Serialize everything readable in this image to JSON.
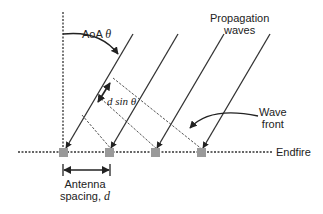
{
  "labels": {
    "aoa": "AoA",
    "theta": "θ",
    "propagation_line1": "Propagation",
    "propagation_line2": "waves",
    "dsin": "d sin θ",
    "wave_line1": "Wave",
    "wave_line2": "front",
    "endfire": "Endfire",
    "antenna_line1": "Antenna",
    "antenna_line2": "spacing,",
    "d": "d"
  },
  "elements": {
    "antennas": 4,
    "propagation_waves": 4,
    "wave_fronts": 3
  },
  "colors": {
    "line": "#333333",
    "antenna": "#9a9a9a",
    "dashed": "#555555"
  }
}
